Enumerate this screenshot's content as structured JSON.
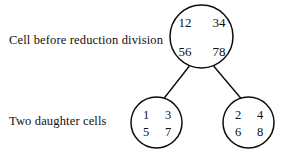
{
  "figure": {
    "background_color": "#ffffff",
    "stroke_color": "#0d0d0d",
    "text_color": "#101010"
  },
  "captions": {
    "parent": "Cell before reduction division",
    "daughters": "Two daughter cells"
  },
  "parent_cell": {
    "name": "parent-cell",
    "chromosomes": {
      "top_left": "12",
      "top_right": "34",
      "bottom_left": "56",
      "bottom_right": "78"
    }
  },
  "daughter_cells": [
    {
      "name": "left-daughter-cell",
      "chromosomes": {
        "top_left": "1",
        "top_right": "3",
        "bottom_left": "5",
        "bottom_right": "7"
      }
    },
    {
      "name": "right-daughter-cell",
      "chromosomes": {
        "top_left": "2",
        "top_right": "4",
        "bottom_left": "6",
        "bottom_right": "8"
      }
    }
  ]
}
